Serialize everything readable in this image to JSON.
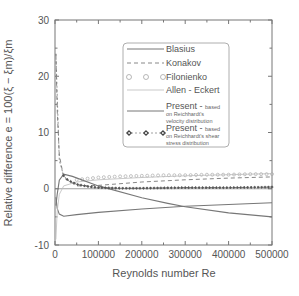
{
  "chart_data": {
    "type": "line",
    "title": "",
    "xlabel": "Reynolds number Re",
    "ylabel": "Relative difference e = 100(ξ − ξm)/ξm",
    "xlim": [
      0,
      500000
    ],
    "ylim": [
      -10,
      30
    ],
    "x_ticks": [
      "0",
      "100000",
      "200000",
      "300000",
      "400000",
      "500000"
    ],
    "y_ticks": [
      "-10",
      "0",
      "10",
      "20",
      "30"
    ],
    "grid": false,
    "legend_position": "upper-center",
    "series": [
      {
        "name": "Blasius",
        "style": "solid",
        "x": [
          2000,
          5000,
          10000,
          20000,
          50000,
          100000,
          200000,
          300000,
          400000,
          500000
        ],
        "y": [
          -1.5,
          -3.5,
          -4.5,
          -4.9,
          -4.6,
          -4.2,
          -3.6,
          -3.1,
          -2.8,
          -2.5
        ]
      },
      {
        "name": "Konakov",
        "style": "dashed",
        "x": [
          2000,
          5000,
          10000,
          20000,
          50000,
          100000,
          200000,
          300000,
          400000,
          500000
        ],
        "y": [
          24,
          14,
          6,
          2,
          0.5,
          0.6,
          1.2,
          1.6,
          1.9,
          2.1
        ]
      },
      {
        "name": "Filonienko",
        "style": "circles",
        "x": [
          50000,
          100000,
          150000,
          200000,
          250000,
          300000,
          350000,
          400000,
          450000,
          500000
        ],
        "y": [
          1.6,
          2.0,
          2.2,
          2.3,
          2.4,
          2.4,
          2.5,
          2.5,
          2.6,
          2.6
        ]
      },
      {
        "name": "Allen - Eckert",
        "style": "thin-solid",
        "x": [
          2000,
          5000,
          10000,
          20000,
          50000,
          100000,
          200000,
          300000,
          400000,
          500000
        ],
        "y": [
          -9,
          -4,
          -1,
          0.5,
          1.2,
          1.6,
          2.0,
          2.3,
          2.5,
          2.7
        ]
      },
      {
        "name": "Present - based on Reichhardt's velocity distribution",
        "style": "solid",
        "x": [
          2000,
          5000,
          10000,
          20000,
          40000,
          100000,
          200000,
          260000,
          300000,
          400000,
          500000
        ],
        "y": [
          -3,
          -1,
          1.5,
          2.6,
          2.2,
          0.5,
          -1.6,
          -2.6,
          -3.2,
          -4.3,
          -5.0
        ]
      },
      {
        "name": "Present - based on Reichhardt's shear stress distribution",
        "style": "diamonds-dashed",
        "x": [
          2000,
          10000,
          20000,
          30000,
          50000,
          75000,
          100000,
          150000,
          200000,
          300000,
          400000,
          500000
        ],
        "y": [
          24,
          5,
          2.3,
          1.5,
          0.8,
          0.4,
          0.2,
          0.1,
          0.1,
          0.2,
          0.2,
          0.3
        ]
      }
    ]
  },
  "legend": {
    "items": [
      {
        "label": "Blasius",
        "sub": ""
      },
      {
        "label": "Konakov",
        "sub": ""
      },
      {
        "label": "Filonienko",
        "sub": ""
      },
      {
        "label": "Allen - Eckert",
        "sub": ""
      },
      {
        "label": "Present - ",
        "small": "based",
        "sub1": "on Reichhardt's",
        "sub2": "velocity distribution"
      },
      {
        "label": "Present - ",
        "small": "based",
        "sub1": "on Reichhardt's shear",
        "sub2": "stress distribution"
      }
    ]
  },
  "axes": {
    "xlabel": "Reynolds number Re",
    "ylabel": "Relative difference e = 100(ξ − ξm)/ξm",
    "x_ticks": [
      "0",
      "100000",
      "200000",
      "300000",
      "400000",
      "500000"
    ],
    "y_ticks": [
      "-10",
      "0",
      "10",
      "20",
      "30"
    ]
  }
}
